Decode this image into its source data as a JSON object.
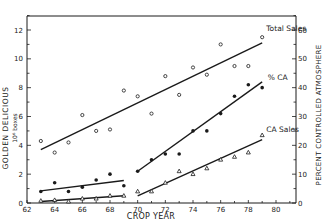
{
  "chart_data": {
    "type": "scatter",
    "title": "",
    "xlabel": "CROP YEAR",
    "ylabel_left_line1": "GOLDEN DELICIOUS",
    "ylabel_left_line2": "10⁶ boxes",
    "ylabel_right": "PERCENT CONTROLLED ATMOSPHERE",
    "xlim": [
      62,
      81.5
    ],
    "ylim_left": [
      0,
      13
    ],
    "ylim_right": [
      0,
      65
    ],
    "x_ticks": [
      62,
      64,
      66,
      68,
      70,
      72,
      74,
      76,
      78,
      80
    ],
    "y_ticks_left": [
      0,
      2,
      4,
      6,
      8,
      10,
      12
    ],
    "y_ticks_right": [
      0,
      10,
      20,
      30,
      40,
      50,
      60
    ],
    "grid": false,
    "legend_position": "inline-labels-right",
    "series": [
      {
        "name": "Total Sales",
        "marker": "open-circle",
        "axis": "left",
        "x": [
          63,
          64,
          65,
          66,
          67,
          68,
          69,
          70,
          71,
          72,
          73,
          74,
          75,
          76,
          77,
          78,
          79
        ],
        "values": [
          4.3,
          3.5,
          4.2,
          6.1,
          5.0,
          5.1,
          7.8,
          7.4,
          6.2,
          8.8,
          7.5,
          9.4,
          8.9,
          11.0,
          9.5,
          9.5,
          11.5
        ],
        "fit_segments": [
          [
            63,
            3.7,
            79,
            11.1
          ]
        ]
      },
      {
        "name": "% CA",
        "marker": "filled-circle",
        "axis": "right",
        "x": [
          63,
          64,
          65,
          66,
          67,
          68,
          69,
          70,
          71,
          72,
          73,
          74,
          75,
          76,
          77,
          78,
          79
        ],
        "values": [
          4.0,
          7.0,
          4.0,
          5.5,
          8.0,
          10.0,
          6.0,
          11.0,
          15.0,
          17.0,
          17.0,
          25.0,
          25.0,
          31.0,
          37.0,
          41.0,
          40.0
        ],
        "fit_segments": [
          [
            63,
            4.2,
            69,
            7.8
          ],
          [
            70,
            11.0,
            79,
            42.0
          ]
        ]
      },
      {
        "name": "CA Sales",
        "marker": "open-triangle",
        "axis": "left",
        "x": [
          63,
          64,
          65,
          66,
          67,
          68,
          69,
          70,
          71,
          72,
          73,
          74,
          75,
          76,
          77,
          78,
          79
        ],
        "values": [
          0.15,
          0.2,
          0.1,
          0.3,
          0.3,
          0.5,
          0.5,
          0.8,
          0.8,
          1.4,
          2.2,
          2.0,
          2.4,
          3.0,
          3.2,
          3.5,
          4.7
        ],
        "fit_segments": [
          [
            63,
            0.1,
            69,
            0.5
          ],
          [
            70,
            0.5,
            79,
            4.4
          ]
        ]
      }
    ]
  }
}
